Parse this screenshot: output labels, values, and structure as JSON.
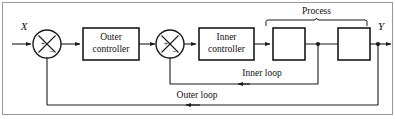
{
  "figure": {
    "frame_color": "#9a9a9a",
    "line_color": "#1a1a1a",
    "block_fill": "#ffffff",
    "text_color": "#111111"
  },
  "signals": {
    "input_label": "X",
    "output_label": "Y"
  },
  "summing_junctions": [
    {
      "name": "outer-summing-junction",
      "positive_sign": "+",
      "negative_sign": "−",
      "positive_position": "left",
      "negative_position": "bottom"
    },
    {
      "name": "inner-summing-junction",
      "positive_sign": "+",
      "negative_sign": "−",
      "positive_position": "left",
      "negative_position": "bottom"
    }
  ],
  "blocks": [
    {
      "name": "outer-controller-block",
      "line1": "Outer",
      "line2": "controller"
    },
    {
      "name": "inner-controller-block",
      "line1": "Inner",
      "line2": "controller"
    },
    {
      "name": "process-block-1",
      "line1": "",
      "line2": ""
    },
    {
      "name": "process-block-2",
      "line1": "",
      "line2": ""
    }
  ],
  "annotations": {
    "process_brace_label": "Process",
    "inner_loop_label": "Inner loop",
    "outer_loop_label": "Outer loop"
  }
}
